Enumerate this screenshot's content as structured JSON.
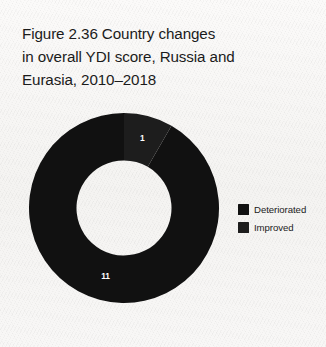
{
  "figure": {
    "title": "Figure 2.36  Country changes\nin overall YDI score, Russia and\nEurasia, 2010–2018"
  },
  "legend": {
    "position": "right",
    "items": [
      {
        "label": "Deteriorated",
        "color": "#111111",
        "swatch_icon": "square-swatch"
      },
      {
        "label": "Improved",
        "color": "#1d1d1d",
        "swatch_icon": "square-swatch"
      }
    ]
  },
  "chart_data": {
    "type": "pie",
    "variant": "donut",
    "title": "Figure 2.36  Country changes in overall YDI score, Russia and Eurasia, 2010–2018",
    "xlabel": "",
    "ylabel": "",
    "categories": [
      "Deteriorated",
      "Improved"
    ],
    "values": [
      11,
      1
    ],
    "total": 12,
    "units": "countries",
    "data_labels": [
      "11",
      "1"
    ],
    "colors": [
      "#111111",
      "#1d1d1d"
    ],
    "label_color": "#ffffff",
    "start_angle_deg": 0,
    "direction": "clockwise",
    "inner_radius_ratio": 0.5,
    "legend_position": "right",
    "grid": false,
    "slices": [
      {
        "name": "Deteriorated",
        "value": 11,
        "percent": 91.7,
        "angle_deg": 330,
        "label": "11",
        "color": "#111111"
      },
      {
        "name": "Improved",
        "value": 1,
        "percent": 8.3,
        "angle_deg": 30,
        "label": "1",
        "color": "#1d1d1d"
      }
    ]
  }
}
